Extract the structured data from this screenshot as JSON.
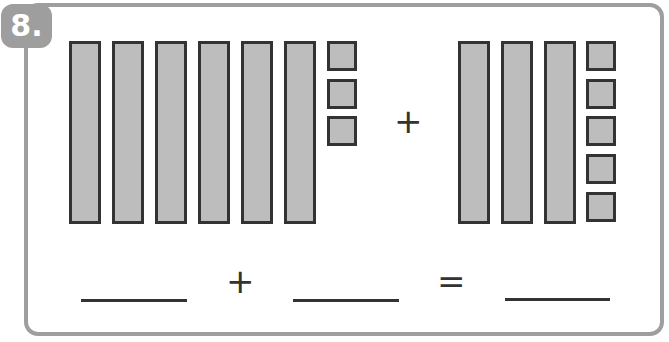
{
  "problem": {
    "number": "8.",
    "left_group": {
      "tens": 6,
      "ones": 3
    },
    "right_group": {
      "tens": 3,
      "ones": 5
    },
    "top_operator": "+",
    "equation": {
      "operator": "+",
      "equals": "=",
      "blanks": [
        "",
        "",
        ""
      ]
    }
  },
  "colors": {
    "frame": "#9e9e9e",
    "block_fill": "#bdbdbd",
    "block_border": "#333333"
  }
}
